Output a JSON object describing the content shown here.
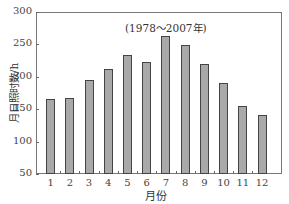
{
  "chart_data": {
    "type": "bar",
    "title": "",
    "annotation": "(1978～2007年)",
    "xlabel": "月份",
    "ylabel": "月日照时数/h",
    "categories": [
      "1",
      "2",
      "3",
      "4",
      "5",
      "6",
      "7",
      "8",
      "9",
      "10",
      "11",
      "12"
    ],
    "values": [
      166,
      167,
      195,
      212,
      234,
      223,
      263,
      249,
      220,
      190,
      155,
      141
    ],
    "ylim": [
      50,
      300
    ],
    "yticks": [
      50,
      100,
      150,
      200,
      250,
      300
    ],
    "grid": false,
    "legend": null,
    "bar_color": "#a9a9a9",
    "bar_edge_color": "#444444"
  }
}
